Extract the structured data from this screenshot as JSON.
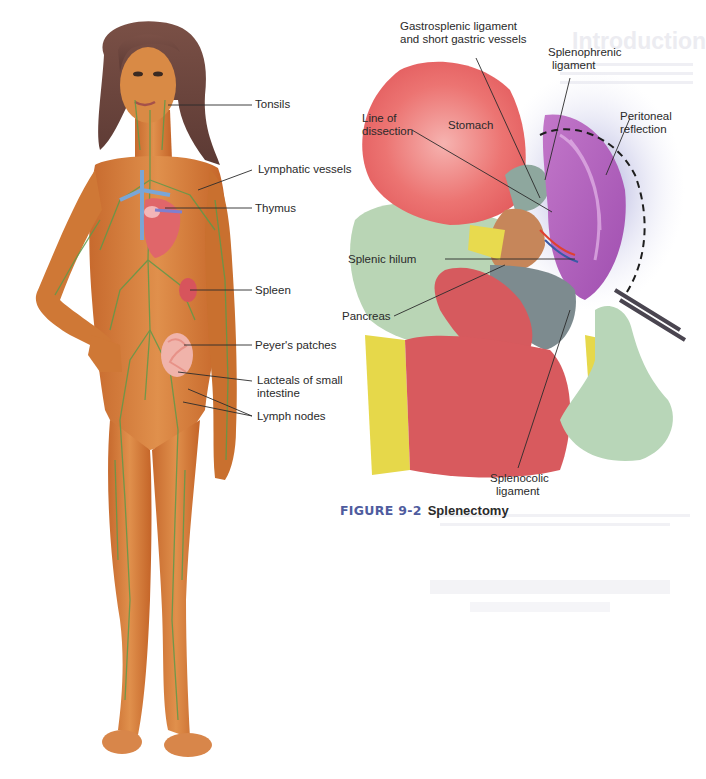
{
  "left_figure": {
    "subject": "lymphatic-system-body-illustration",
    "labels": [
      {
        "id": "tonsils",
        "text": "Tonsils"
      },
      {
        "id": "lymphatic-vessels",
        "text": "Lymphatic vessels"
      },
      {
        "id": "thymus",
        "text": "Thymus"
      },
      {
        "id": "spleen",
        "text": "Spleen"
      },
      {
        "id": "peyers-patches",
        "text": "Peyer's patches"
      },
      {
        "id": "lacteals-line1",
        "text": "Lacteals of small"
      },
      {
        "id": "lacteals-line2",
        "text": "intestine"
      },
      {
        "id": "lymph-nodes",
        "text": "Lymph nodes"
      }
    ]
  },
  "right_figure": {
    "subject": "splenectomy-surgical-illustration",
    "labels": [
      {
        "id": "gastrosplenic-line1",
        "text": "Gastrosplenic ligament"
      },
      {
        "id": "gastrosplenic-line2",
        "text": "and short gastric vessels"
      },
      {
        "id": "splenophrenic-line1",
        "text": "Splenophrenic"
      },
      {
        "id": "splenophrenic-line2",
        "text": "ligament"
      },
      {
        "id": "line-of-dissection-line1",
        "text": "Line of"
      },
      {
        "id": "line-of-dissection-line2",
        "text": "dissection"
      },
      {
        "id": "stomach",
        "text": "Stomach"
      },
      {
        "id": "peritoneal-line1",
        "text": "Peritoneal"
      },
      {
        "id": "peritoneal-line2",
        "text": "reflection"
      },
      {
        "id": "splenic-hilum",
        "text": "Splenic hilum"
      },
      {
        "id": "pancreas",
        "text": "Pancreas"
      },
      {
        "id": "splenocolic-line1",
        "text": "Splenocolic"
      },
      {
        "id": "splenocolic-line2",
        "text": "ligament"
      }
    ],
    "caption": {
      "number": "FIGURE 9-2",
      "title": "Splenectomy"
    }
  },
  "colors": {
    "caption_number": "#4f5c9e",
    "skin": "#d9803f",
    "lymph_green": "#5e9a4a",
    "stomach_red": "#e86a6a",
    "spleen_purple": "#b866c0",
    "glove_green": "#b8d6b8",
    "fat_yellow": "#e6d84a"
  }
}
